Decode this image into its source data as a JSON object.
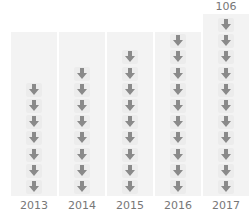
{
  "chart_data": {
    "type": "bar",
    "subtype": "pictograph",
    "title": "",
    "xlabel": "",
    "ylabel": "",
    "categories": [
      "2013",
      "2014",
      "2015",
      "2016",
      "2017"
    ],
    "icon_counts": [
      7,
      8,
      9,
      10,
      11
    ],
    "icon": "arrow-down-icon",
    "data_labels": [
      {
        "category": "2017",
        "text": "106"
      }
    ],
    "grid": true,
    "legend": null
  },
  "colors": {
    "icon": "#8a8a8a",
    "icon_bg": "#ececec",
    "column_bg": "#f3f3f3",
    "text": "#777777"
  }
}
